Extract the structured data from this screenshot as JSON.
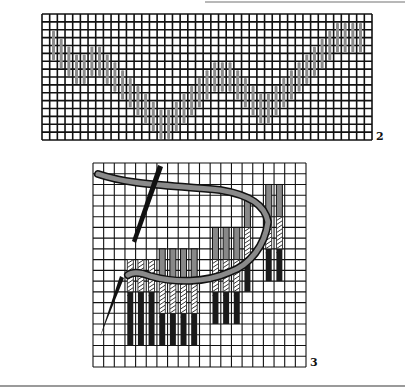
{
  "figures": [
    {
      "label": "2",
      "description": "Bargello canvas grid with wavy line of upright gray stitches",
      "grid": {
        "x": 42,
        "y": 14,
        "width": 330,
        "height": 126,
        "cols": 43,
        "rows": 16
      },
      "stitch_color": "#8c8c8c"
    },
    {
      "label": "3",
      "description": "Canvas grid showing needle and thread working upright stitches in steps",
      "grid": {
        "x": 93,
        "y": 163,
        "width": 213,
        "height": 204,
        "cols": 20,
        "rows": 19
      },
      "colors": {
        "thread": "#888888",
        "dark_stitch": "#1a1a1a",
        "needle": "#111111"
      }
    }
  ],
  "colors": {
    "grid_line": "#111111",
    "background": "#ffffff"
  }
}
